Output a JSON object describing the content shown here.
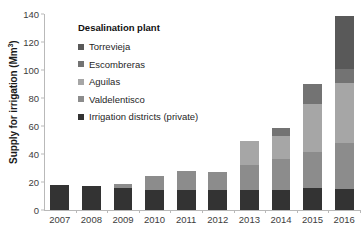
{
  "chart_data": {
    "type": "bar",
    "subtype": "stacked-bar",
    "title": "",
    "xlabel": "",
    "ylabel": "Supply for irrigation (Mm³)",
    "ylim": [
      0,
      140
    ],
    "ytick_step": 20,
    "yticks": [
      0,
      20,
      40,
      60,
      80,
      100,
      120,
      140
    ],
    "grid": false,
    "legend_position": "inside-top-left",
    "legend_title": "Desalination plant",
    "categories": [
      "2007",
      "2008",
      "2009",
      "2010",
      "2011",
      "2012",
      "2013",
      "2014",
      "2015",
      "2016"
    ],
    "series": [
      {
        "name": "Irrigation districts (private)",
        "color": "#333333",
        "values": [
          17.8,
          16.8,
          16.0,
          14.4,
          14.4,
          14.4,
          14.6,
          14.6,
          15.4,
          15.2
        ]
      },
      {
        "name": "Valdelentisco",
        "color": "#8c8c8c",
        "values": [
          0,
          0,
          2.6,
          9.6,
          13.2,
          12.4,
          17.2,
          22.0,
          26.0,
          32.6
        ]
      },
      {
        "name": "Aguilas",
        "color": "#a6a6a6",
        "values": [
          0,
          0,
          0,
          0,
          0,
          0,
          17.2,
          16.4,
          34.4,
          43.2
        ]
      },
      {
        "name": "Escombreras",
        "color": "#737373",
        "values": [
          0,
          0,
          0,
          0,
          0,
          0,
          0,
          5.5,
          14.2,
          9.5
        ]
      },
      {
        "name": "Torrevieja",
        "color": "#595959",
        "values": [
          0,
          0,
          0,
          0,
          0,
          0,
          0,
          0,
          0,
          38.0
        ]
      }
    ],
    "totals": [
      17.8,
      16.8,
      18.6,
      24.0,
      27.6,
      26.8,
      49.0,
      58.5,
      90.0,
      138.5
    ]
  },
  "legend": {
    "title": "Desalination plant",
    "items": [
      {
        "label": "Torrevieja",
        "color": "#595959"
      },
      {
        "label": "Escombreras",
        "color": "#737373"
      },
      {
        "label": "Aguilas",
        "color": "#a6a6a6"
      },
      {
        "label": "Valdelentisco",
        "color": "#8c8c8c"
      },
      {
        "label": "Irrigation districts (private)",
        "color": "#333333"
      }
    ]
  },
  "axes": {
    "y_title_main": "Supply for irrigation (Mm",
    "y_title_sup": "3",
    "y_title_close": ")"
  }
}
